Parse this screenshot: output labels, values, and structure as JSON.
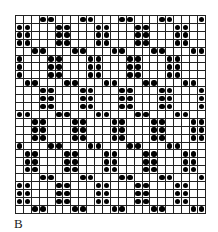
{
  "figure": {
    "label": "B",
    "grid": {
      "columns": 24,
      "rows": 25,
      "dot_color": "#000000",
      "line_color": "#222222",
      "cells": [
        "000110001100011000110001",
        "110001100011000110001100",
        "110001100011000110001100",
        "110001100011000110001100",
        "001100011000110001100011",
        "100011000110001100011000",
        "100011000110001100011000",
        "100011000110001100011000",
        "011000110001100011000110",
        "000110001100011000110001",
        "000110001100011000110001",
        "000110001100011000110001",
        "110001100011000110001100",
        "001100011000110001100011",
        "001100011000110001100011",
        "001100011000110001100011",
        "100011000110001100011000",
        "011000110001100011000110",
        "011000110001100011000110",
        "011000110001100011000110",
        "000110001100011000110001",
        "110001100011000110001100",
        "110001100011000110001100",
        "110001100011000110001100",
        "001100011000110001100011"
      ]
    }
  }
}
